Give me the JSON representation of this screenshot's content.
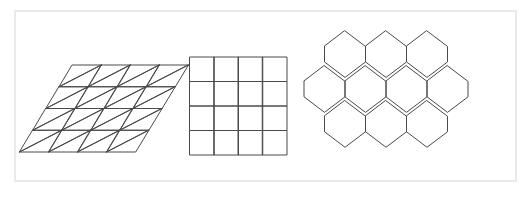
{
  "figure": {
    "background_color": "#ffffff",
    "frame": {
      "name": "figure-border",
      "color": "#e9e9e9",
      "x": 14,
      "y": 10,
      "width": 503,
      "height": 172,
      "stroke_width": 2
    },
    "line_color": "#4a4a4a",
    "line_width": 1
  },
  "tilings": [
    {
      "id": "triangular-tiling",
      "label": "Triangular tiling",
      "shape": "equilateral-triangle",
      "outline": "rhombus",
      "rows": 4,
      "columns": 4,
      "cell_count": 32,
      "vertices_per_tile": 3,
      "schlafli": "{3,6}",
      "bounds": {
        "x": 46,
        "y": 65,
        "width": 117,
        "height": 87
      },
      "geometry": {
        "origin_x": 72.5,
        "origin_y": 65.0,
        "cell_width": 29.0,
        "cell_height": 21.75,
        "row_shift_x": -13.2
      }
    },
    {
      "id": "square-tiling",
      "label": "Square tiling",
      "shape": "square",
      "outline": "square",
      "rows": 4,
      "columns": 4,
      "cell_count": 16,
      "vertices_per_tile": 4,
      "schlafli": "{4,4}",
      "bounds": {
        "x": 190,
        "y": 57,
        "width": 97,
        "height": 98
      },
      "geometry": {
        "origin_x": 190.0,
        "origin_y": 57.0,
        "cell_width": 24.25,
        "cell_height": 24.5
      }
    },
    {
      "id": "hexagonal-tiling",
      "label": "Hexagonal tiling",
      "shape": "regular-hexagon",
      "outline": "honeycomb",
      "orientation": "pointy-top",
      "rows": 3,
      "row_counts": [
        3,
        4,
        3
      ],
      "cell_count": 10,
      "vertices_per_tile": 6,
      "schlafli": "{6,3}",
      "bounds": {
        "x": 304,
        "y": 31,
        "width": 164,
        "height": 124
      },
      "geometry": {
        "hex_width": 41.0,
        "hex_height": 46.5,
        "side_length": 15.5,
        "row_step_y": 34.9,
        "row_offset_x": 20.5,
        "first_center_x": 345.0,
        "first_center_y": 54.2
      }
    }
  ]
}
